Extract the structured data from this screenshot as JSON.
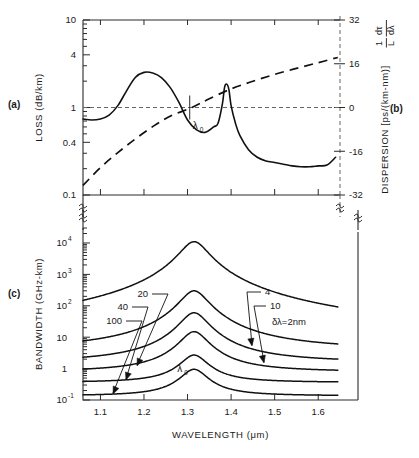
{
  "figure": {
    "panels": {
      "a_label": "(a)",
      "b_label": "(b)",
      "c_label": "(c)"
    },
    "lambda_zero_label": "λ",
    "lambda_zero_sub": "0"
  },
  "chart_data": [
    {
      "type": "line",
      "id": "panel-a-loss",
      "panel": "(a)",
      "title": "",
      "xlabel": "WAVELENGTH (μm)",
      "ylabel": "LOSS  (dB/km)",
      "xlim": [
        1.06,
        1.65
      ],
      "ylim": [
        0.1,
        10
      ],
      "yscale": "log",
      "ytick_labels": [
        "10",
        "4",
        "1",
        "0.4",
        "0.1"
      ],
      "ytick_values": [
        10,
        4,
        1,
        0.4,
        0.1
      ],
      "xtick_values": [
        1.1,
        1.2,
        1.3,
        1.4,
        1.5,
        1.6
      ],
      "grid": false,
      "annotations": [
        "λ0 marker at 1.31 μm"
      ],
      "series": [
        {
          "name": "Loss (dB/km)",
          "x": [
            1.06,
            1.08,
            1.1,
            1.12,
            1.14,
            1.16,
            1.18,
            1.2,
            1.22,
            1.24,
            1.26,
            1.28,
            1.3,
            1.32,
            1.34,
            1.36,
            1.37,
            1.38,
            1.385,
            1.39,
            1.395,
            1.4,
            1.41,
            1.42,
            1.44,
            1.46,
            1.48,
            1.5,
            1.52,
            1.54,
            1.56,
            1.58,
            1.6,
            1.62,
            1.64
          ],
          "y": [
            0.74,
            0.72,
            0.74,
            0.82,
            1.05,
            1.55,
            2.2,
            2.52,
            2.48,
            2.2,
            1.7,
            1.15,
            0.72,
            0.56,
            0.52,
            0.6,
            0.66,
            1.1,
            1.7,
            1.85,
            1.6,
            1.05,
            0.66,
            0.48,
            0.33,
            0.27,
            0.245,
            0.235,
            0.225,
            0.215,
            0.21,
            0.21,
            0.215,
            0.22,
            0.27
          ]
        }
      ]
    },
    {
      "type": "line",
      "id": "panel-b-dispersion",
      "panel": "(b)",
      "title": "",
      "xlabel": "WAVELENGTH (μm)",
      "ylabel": "DISPERSION [ps/(km-nm)]   (1/L)(dτ/dλ)",
      "ylabel_parts": {
        "main": "DISPERSION [ps/(km-nm)]",
        "frac_num": "dτ",
        "frac_den": "dλ",
        "prefix_num": "1",
        "prefix_den": "L"
      },
      "xlim": [
        1.06,
        1.65
      ],
      "ylim": [
        -32,
        32
      ],
      "yscale": "linear",
      "ytick_labels": [
        "32",
        "16",
        "0",
        "-16",
        "-32"
      ],
      "ytick_values": [
        32,
        16,
        0,
        -16,
        -32
      ],
      "grid": false,
      "zero_line": true,
      "series": [
        {
          "name": "Dispersion 1/L dτ/dλ [ps/(km-nm)]",
          "x": [
            1.06,
            1.1,
            1.14,
            1.18,
            1.22,
            1.26,
            1.31,
            1.35,
            1.4,
            1.45,
            1.5,
            1.55,
            1.6,
            1.645
          ],
          "y": [
            -28.5,
            -22.0,
            -16.5,
            -11.5,
            -7.0,
            -3.2,
            0.0,
            3.2,
            6.8,
            9.6,
            12.1,
            14.3,
            16.4,
            18.3
          ]
        }
      ]
    },
    {
      "type": "line",
      "id": "panel-c-bandwidth",
      "panel": "(c)",
      "title": "",
      "xlabel": "WAVELENGTH (μm)",
      "ylabel": "BANDWIDTH (GHz-km)",
      "xlim": [
        1.06,
        1.65
      ],
      "ylim": [
        0.1,
        30000
      ],
      "yscale": "log",
      "ytick_labels": [
        "10⁴",
        "10³",
        "10²",
        "10",
        "1",
        "10⁻¹"
      ],
      "ytick_values": [
        10000,
        1000,
        100,
        10,
        1,
        0.1
      ],
      "xtick_values": [
        1.1,
        1.2,
        1.3,
        1.4,
        1.5,
        1.6
      ],
      "grid": false,
      "peak_wavelength": 1.315,
      "lambda_zero_annotation": "λ0",
      "spectral_width_unit": "nm",
      "delta_lambda_label": "δλ=2nm",
      "series": [
        {
          "name": "δλ = 2 nm",
          "label": "2",
          "delta_lambda": 2,
          "peak_value": 11000,
          "edge_left": 7.0,
          "edge_right": 7.0,
          "label_side": "right"
        },
        {
          "name": "δλ = 4 nm",
          "label": "4",
          "delta_lambda": 4,
          "peak_value": 300,
          "edge_left": 3.8,
          "edge_right": 3.8,
          "label_side": "right"
        },
        {
          "name": "δλ = 10 nm",
          "label": "10",
          "delta_lambda": 10,
          "peak_value": 60,
          "edge_left": 1.55,
          "edge_right": 1.55,
          "label_side": "right"
        },
        {
          "name": "δλ = 20 nm",
          "label": "20",
          "delta_lambda": 20,
          "peak_value": 15,
          "edge_left": 0.78,
          "edge_right": 0.78,
          "label_side": "left"
        },
        {
          "name": "δλ = 40 nm",
          "label": "40",
          "delta_lambda": 40,
          "peak_value": 2.7,
          "edge_left": 0.36,
          "edge_right": 0.36,
          "label_side": "left"
        },
        {
          "name": "δλ = 100 nm",
          "label": "100",
          "delta_lambda": 100,
          "peak_value": 0.95,
          "edge_left": 0.135,
          "edge_right": 0.135,
          "label_side": "left"
        }
      ],
      "curve_labels": [
        "20",
        "40",
        "100",
        "4",
        "10",
        "δλ=2nm"
      ]
    }
  ],
  "axis_titles": {
    "loss": "LOSS  (dB/km)",
    "dispersion_main": "DISPERSION [ps/(km-nm)]",
    "bandwidth": "BANDWIDTH (GHz-km)",
    "wavelength": "WAVELENGTH (μm)"
  },
  "tick_text": {
    "loss_y": [
      "10",
      "4",
      "1",
      "0.4",
      "0.1"
    ],
    "disp_y": [
      "32",
      "16",
      "0",
      "-16",
      "-32"
    ],
    "bw_y_mant": [
      "10",
      "10",
      "10",
      "10",
      "1",
      "10"
    ],
    "bw_y_sup": [
      "4",
      "3",
      "2",
      "",
      "",
      "-1"
    ],
    "x": [
      "1.1",
      "1.2",
      "1.3",
      "1.4",
      "1.5",
      "1.6"
    ]
  }
}
